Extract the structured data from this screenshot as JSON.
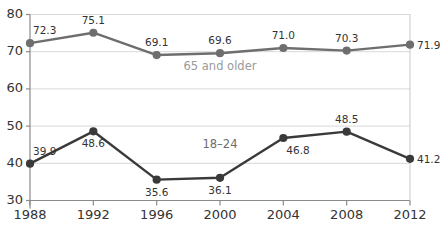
{
  "chart_data": {
    "type": "line",
    "title": "",
    "subtitle": "",
    "xlabel": "",
    "ylabel": "",
    "categories": [
      "1988",
      "1992",
      "1996",
      "2000",
      "2004",
      "2008",
      "2012"
    ],
    "x": [
      1988,
      1992,
      1996,
      2000,
      2004,
      2008,
      2012
    ],
    "ylim": [
      30,
      80
    ],
    "yticks": [
      30,
      40,
      50,
      60,
      70,
      80
    ],
    "ytick_labels": [
      "30",
      "40",
      "50",
      "60",
      "70",
      "80"
    ],
    "grid": "horizontal",
    "legend": "inline-series-labels",
    "series": [
      {
        "name": "65 and older",
        "color": "#6e6e6e",
        "values": [
          72.3,
          75.1,
          69.1,
          69.6,
          71.0,
          70.3,
          71.9
        ],
        "value_labels": [
          "72.3",
          "75.1",
          "69.1",
          "69.6",
          "71.0",
          "70.3",
          "71.9"
        ],
        "label_positions": [
          "above-right",
          "above",
          "above",
          "above",
          "above",
          "above",
          "right"
        ],
        "inline_label_at": {
          "x": 2000,
          "y": 65.2
        }
      },
      {
        "name": "18–24",
        "color": "#3a3a3a",
        "values": [
          39.9,
          48.6,
          35.6,
          36.1,
          46.8,
          48.5,
          41.2
        ],
        "value_labels": [
          "39.9",
          "48.6",
          "35.6",
          "36.1",
          "46.8",
          "48.5",
          "41.2"
        ],
        "label_positions": [
          "above-right",
          "below",
          "below",
          "below",
          "below-right",
          "above",
          "right"
        ],
        "inline_label_at": {
          "x": 2000,
          "y": 44.2
        }
      }
    ]
  },
  "axes": {
    "y_axis_name": "y-axis",
    "x_axis_name": "x-axis"
  }
}
